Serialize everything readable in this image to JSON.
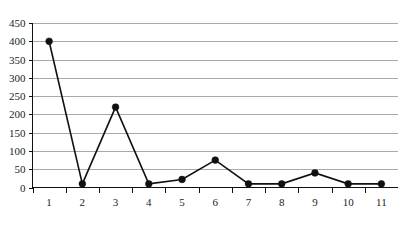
{
  "chart_data": {
    "type": "line",
    "title": "",
    "subtitle": "",
    "xlabel": "",
    "ylabel": "",
    "categories": [
      "1",
      "2",
      "3",
      "4",
      "5",
      "6",
      "7",
      "8",
      "9",
      "10",
      "11"
    ],
    "values": [
      400,
      10,
      220,
      10,
      22,
      75,
      10,
      10,
      40,
      10,
      10
    ],
    "series": [
      {
        "name": "series-1",
        "values": [
          400,
          10,
          220,
          10,
          22,
          75,
          10,
          10,
          40,
          10,
          10
        ]
      }
    ],
    "ylim": [
      0,
      450
    ],
    "ytick_labels": [
      "0",
      "50",
      "100",
      "150",
      "200",
      "250",
      "300",
      "350",
      "400",
      "450"
    ],
    "ytick_values": [
      0,
      50,
      100,
      150,
      200,
      250,
      300,
      350,
      400,
      450
    ],
    "xtick_labels": [
      "1",
      "2",
      "3",
      "4",
      "5",
      "6",
      "7",
      "8",
      "9",
      "10",
      "11"
    ],
    "grid": true,
    "grid_orientation": "horizontal",
    "legend": false,
    "legend_position": "none",
    "marker": "filled-circle",
    "line_color": "#111111",
    "marker_color": "#111111",
    "grid_color": "#a9a9a9",
    "axis_color": "#111111",
    "background_color": "#ffffff",
    "annotations": []
  },
  "caption": {
    "text": ""
  }
}
